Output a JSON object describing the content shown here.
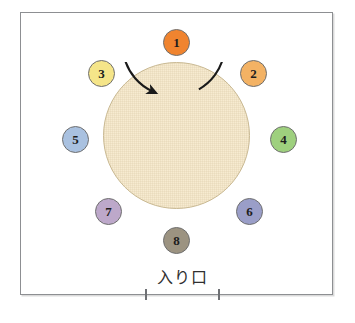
{
  "diagram": {
    "title": "",
    "frame": {
      "name": "room-outline"
    },
    "center_area": {
      "name": "central-circular-platform",
      "fill_color": "#f7ebd0",
      "stroke_color": "#c9b993"
    },
    "rotation_arrow": {
      "name": "counterclockwise-rotation-arrow",
      "direction": "clockwise",
      "color": "#1a1a1a"
    },
    "entrance": {
      "label": "入り口",
      "tick_left": "",
      "tick_right": ""
    },
    "stations": [
      {
        "label": "1",
        "color": "#f0842f",
        "x": 163,
        "y": 29
      },
      {
        "label": "2",
        "color": "#f3b264",
        "x": 240,
        "y": 60
      },
      {
        "label": "3",
        "color": "#f5e589",
        "x": 88,
        "y": 60
      },
      {
        "label": "4",
        "color": "#9ed07e",
        "x": 270,
        "y": 126
      },
      {
        "label": "5",
        "color": "#a9c1e0",
        "x": 62,
        "y": 126
      },
      {
        "label": "6",
        "color": "#9a9ec8",
        "x": 236,
        "y": 198
      },
      {
        "label": "7",
        "color": "#bda8ca",
        "x": 95,
        "y": 198
      },
      {
        "label": "8",
        "color": "#9c9381",
        "x": 163,
        "y": 227
      }
    ]
  }
}
